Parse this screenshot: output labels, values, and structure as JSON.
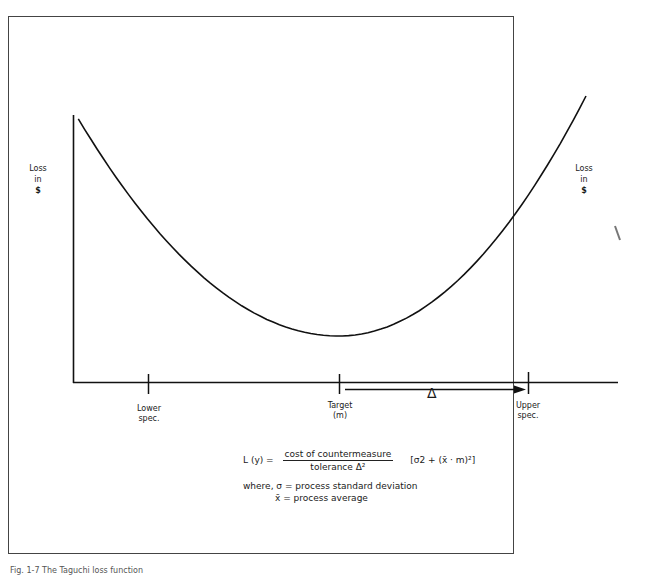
{
  "figure": {
    "y_axis_label_left": [
      "Loss",
      "in",
      "$"
    ],
    "y_axis_label_right": [
      "Loss",
      "in",
      "$"
    ],
    "ticks": [
      {
        "id": "lower",
        "lines": [
          "Lower",
          "spec."
        ]
      },
      {
        "id": "target",
        "lines": [
          "Target",
          "(m)"
        ]
      },
      {
        "id": "upper",
        "lines": [
          "Upper",
          "spec."
        ]
      }
    ],
    "delta_symbol": "Δ",
    "formula": {
      "lhs": "L (y) =",
      "numerator": "cost of countermeasure",
      "denominator": "tolerance Δ²",
      "bracket": "[σ2 + (x̄ · m)²]",
      "where_line1": "where, σ = process standard deviation",
      "where_line2": "x̄ = process average"
    },
    "caption": "Fig. 1-7 The Taguchi loss function"
  },
  "chart_data": {
    "type": "line",
    "title": "Taguchi loss function",
    "xlabel": "",
    "ylabel": "Loss in $",
    "x": [
      -1.4,
      -1.0,
      -0.5,
      0.0,
      0.5,
      1.0,
      1.3
    ],
    "y": [
      1.96,
      1.0,
      0.25,
      0.0,
      0.25,
      1.0,
      1.69
    ],
    "x_ticks": [
      "Lower spec.",
      "Target (m)",
      "Upper spec."
    ],
    "x_tick_values": [
      -1.0,
      0.0,
      1.0
    ],
    "annotations": [
      "Δ = distance from target to upper spec."
    ],
    "grid": false
  }
}
